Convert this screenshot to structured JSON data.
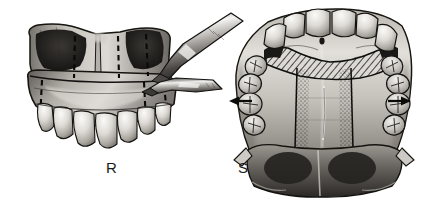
{
  "figure": {
    "background_color": "#ffffff",
    "width": 427,
    "height": 203,
    "style": "grayscale medical line-and-wash illustration",
    "ink_color": "#111111",
    "panel_count": 2
  },
  "panels": [
    {
      "id": "R",
      "label": "R",
      "label_position": {
        "x": 106,
        "y": 160
      },
      "view": "anterior frontal view of down-fractured maxilla",
      "caption_text": "R",
      "features": [
        "down-fractured maxillary segment",
        "dark maxillary sinus cavities",
        "vertical dashed interdental osteotomy lines",
        "horizontal Le Fort I osteotomy line",
        "anterior maxillary tooth row",
        "two surgical osteotomes entering from upper right"
      ],
      "dashed_line_count": 6,
      "instrument_count": 2,
      "instrument_names": [
        "osteotome-upper",
        "osteotome-lower"
      ]
    },
    {
      "id": "S",
      "label": "S",
      "label_position": {
        "x": 238,
        "y": 160
      },
      "view": "occlusal palatal view of maxillary arch",
      "caption_text": "S",
      "features": [
        "full maxillary dental arch",
        "diagonally hatched anterior bone graft band",
        "midpalatal split strip with stippled margins",
        "bilateral outward expansion arrows",
        "posterior soft palate and pharyngeal shadow"
      ],
      "tooth_count": 14,
      "graft_pattern": "diagonal-hatch",
      "midline_pattern": "stipple"
    }
  ],
  "arrows": [
    {
      "name": "expansion-arrow-left",
      "direction": "left",
      "meaning": "transverse expansion",
      "x1": 252,
      "y1": 101,
      "x2": 230,
      "y2": 101
    },
    {
      "name": "expansion-arrow-right",
      "direction": "right",
      "meaning": "transverse expansion",
      "x1": 388,
      "y1": 101,
      "x2": 410,
      "y2": 101
    }
  ],
  "colors": {
    "background": "#ffffff",
    "ink": "#111111",
    "bone_light": "#e8e6e2",
    "bone_mid": "#b5b1ab",
    "bone_dark": "#6e6a65",
    "cavity_dark": "#1e1c1b",
    "tooth_light": "#f2f0ec",
    "tooth_shade": "#a8a49e",
    "hatch": "#1a1a1a",
    "label": "#1b1b1b"
  }
}
